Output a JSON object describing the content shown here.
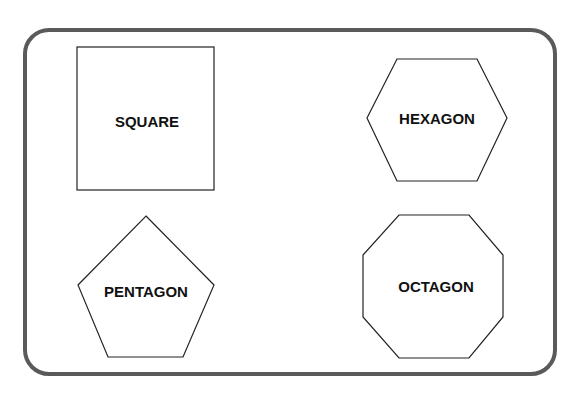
{
  "diagram": {
    "frame": {
      "stroke": "#5a5a5a"
    },
    "shapes": [
      {
        "name": "square",
        "label": "SQUARE"
      },
      {
        "name": "hexagon",
        "label": "HEXAGON"
      },
      {
        "name": "pentagon",
        "label": "PENTAGON"
      },
      {
        "name": "octagon",
        "label": "OCTAGON"
      }
    ]
  }
}
